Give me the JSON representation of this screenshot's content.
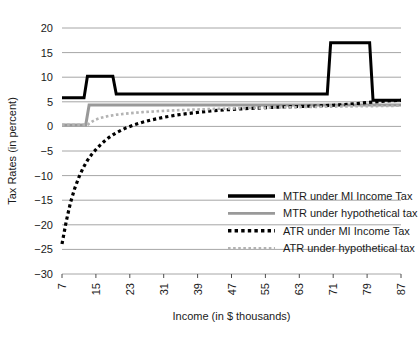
{
  "chart_data": {
    "type": "line",
    "title": "",
    "xlabel": "Income (in $ thousands)",
    "ylabel": "Tax Rates (in percent)",
    "xlim": [
      7,
      87
    ],
    "ylim": [
      -30,
      20
    ],
    "xticks": [
      7,
      15,
      23,
      31,
      39,
      47,
      55,
      63,
      71,
      79,
      87
    ],
    "yticks": [
      20,
      15,
      10,
      5,
      0,
      -5,
      -10,
      -15,
      -20,
      -25,
      -30
    ],
    "xtick_labels": [
      "7",
      "15",
      "23",
      "31",
      "39",
      "47",
      "55",
      "63",
      "71",
      "79",
      "87"
    ],
    "ytick_labels": [
      "20",
      "15",
      "10",
      "5",
      "0",
      "−5",
      "−10",
      "−15",
      "−20",
      "−25",
      "−30"
    ],
    "grid": "horizontal",
    "grid_color": "#a6a6a6",
    "legend_position": "lower-right",
    "series": [
      {
        "name": "MTR under MI Income Tax",
        "style": "solid",
        "color": "#000000",
        "width": 3,
        "x": [
          7,
          12.2,
          12.2,
          13.0,
          13.0,
          19.0,
          19.0,
          19.8,
          19.8,
          69.6,
          69.6,
          70.4,
          70.4,
          79.6,
          79.6,
          80.4,
          80.4,
          87
        ],
        "y": [
          5.8,
          5.8,
          5.8,
          10.2,
          10.2,
          10.2,
          10.2,
          6.6,
          6.6,
          6.6,
          6.6,
          17.0,
          17.0,
          17.0,
          17.0,
          5.3,
          5.3,
          5.3
        ]
      },
      {
        "name": "MTR under hypothetical tax",
        "style": "solid",
        "color": "#999999",
        "width": 3,
        "x": [
          7,
          12.6,
          13.4,
          87
        ],
        "y": [
          0.3,
          0.3,
          4.35,
          4.35
        ]
      },
      {
        "name": "ATR under MI Income Tax",
        "style": "dotted",
        "color": "#000000",
        "width": 3.2,
        "x": [
          7,
          8,
          9,
          10,
          11,
          12,
          13,
          14,
          15,
          16,
          17,
          18,
          19,
          20,
          22,
          24,
          26,
          28,
          31,
          34,
          37,
          40,
          43,
          47,
          51,
          55,
          59,
          63,
          67,
          71,
          75,
          79,
          83,
          87
        ],
        "y": [
          -23.9,
          -19.3,
          -15.5,
          -12.6,
          -10.3,
          -8.4,
          -6.9,
          -5.7,
          -4.7,
          -3.8,
          -3.0,
          -2.3,
          -1.7,
          -1.2,
          -0.35,
          0.3,
          0.85,
          1.3,
          1.85,
          2.3,
          2.65,
          2.95,
          3.2,
          3.45,
          3.65,
          3.8,
          3.95,
          4.05,
          4.15,
          4.3,
          4.5,
          4.85,
          5.15,
          5.3
        ]
      },
      {
        "name": "ATR under hypothetical tax",
        "style": "dotted",
        "color": "#b3b3b3",
        "width": 2.6,
        "x": [
          7,
          10,
          13,
          14,
          15,
          16,
          18,
          20,
          23,
          26,
          29,
          32,
          36,
          40,
          44,
          48,
          53,
          58,
          63,
          68,
          73,
          78,
          83,
          87
        ],
        "y": [
          0.3,
          0.3,
          0.3,
          0.95,
          1.4,
          1.72,
          2.12,
          2.4,
          2.68,
          2.9,
          3.05,
          3.2,
          3.35,
          3.47,
          3.58,
          3.67,
          3.78,
          3.85,
          3.92,
          3.98,
          4.05,
          4.1,
          4.15,
          4.2
        ]
      }
    ],
    "legend": [
      {
        "label": "MTR under MI Income Tax",
        "style": "solid",
        "color": "#000000",
        "width": 3.4
      },
      {
        "label": "MTR under hypothetical tax",
        "style": "solid",
        "color": "#999999",
        "width": 2.6
      },
      {
        "label": "ATR under MI Income Tax",
        "style": "dotted",
        "color": "#000000",
        "width": 3.4
      },
      {
        "label": "ATR under hypothetical tax",
        "style": "dotted",
        "color": "#b3b3b3",
        "width": 2.6
      }
    ]
  }
}
